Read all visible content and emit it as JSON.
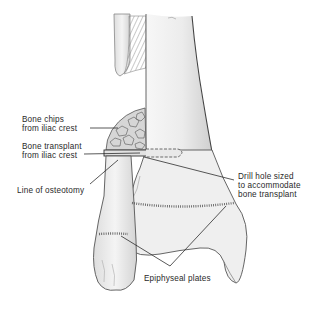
{
  "figure": {
    "colors": {
      "background": "#ffffff",
      "bone_fill": "#eeeeee",
      "bone_outline": "#555555",
      "label_text": "#2a2a2a",
      "leader_line": "#222222"
    }
  },
  "labels": {
    "bone_chips": {
      "line1": "Bone chips",
      "line2": "from iliac crest"
    },
    "bone_transplant": {
      "line1": "Bone transplant",
      "line2": "from iliac crest"
    },
    "osteotomy": {
      "line1": "Line of osteotomy"
    },
    "drill_hole": {
      "line1": "Drill hole sized",
      "line2": "to accommodate",
      "line3": "bone transplant"
    },
    "epiphyseal": {
      "line1": "Epiphyseal plates"
    }
  }
}
